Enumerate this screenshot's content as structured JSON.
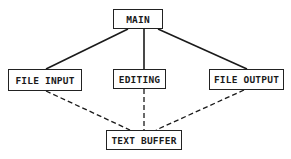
{
  "diagram": {
    "type": "hierarchy",
    "nodes": [
      {
        "id": "main",
        "label": "MAIN"
      },
      {
        "id": "file_input",
        "label": "FILE INPUT"
      },
      {
        "id": "editing",
        "label": "EDITING"
      },
      {
        "id": "file_output",
        "label": "FILE OUTPUT"
      },
      {
        "id": "text_buffer",
        "label": "TEXT BUFFER"
      }
    ],
    "edges": [
      {
        "from": "main",
        "to": "file_input",
        "style": "solid"
      },
      {
        "from": "main",
        "to": "editing",
        "style": "solid"
      },
      {
        "from": "main",
        "to": "file_output",
        "style": "solid"
      },
      {
        "from": "file_input",
        "to": "text_buffer",
        "style": "dashed"
      },
      {
        "from": "editing",
        "to": "text_buffer",
        "style": "dashed"
      },
      {
        "from": "file_output",
        "to": "text_buffer",
        "style": "dashed"
      }
    ]
  }
}
